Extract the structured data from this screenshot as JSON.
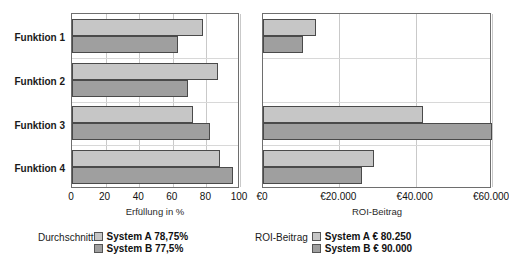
{
  "chart_data": [
    {
      "type": "bar",
      "orientation": "horizontal",
      "title": "",
      "xlabel": "Erfüllung in %",
      "ylabel": "",
      "xlim": [
        0,
        100
      ],
      "xticks": [
        0,
        20,
        40,
        60,
        80,
        100
      ],
      "xtick_labels": [
        "0",
        "20",
        "40",
        "60",
        "80",
        "100"
      ],
      "grid": true,
      "categories": [
        "Funktion 1",
        "Funktion 2",
        "Funktion 3",
        "Funktion 4"
      ],
      "series": [
        {
          "name": "System A",
          "values": [
            78,
            87,
            72,
            88
          ],
          "color": "#c6c6c6"
        },
        {
          "name": "System B",
          "values": [
            63,
            69,
            82,
            96
          ],
          "color": "#9f9f9f"
        }
      ],
      "legend_position": "below",
      "legend_caption": "Durchschnitt",
      "legend_entries": [
        "System A 78,75%",
        "System B 77,5%"
      ]
    },
    {
      "type": "bar",
      "orientation": "horizontal",
      "title": "",
      "xlabel": "ROI-Beitrag",
      "ylabel": "",
      "xlim": [
        0,
        60000
      ],
      "xticks": [
        0,
        20000,
        40000,
        60000
      ],
      "xtick_labels": [
        "€0",
        "€20.000",
        "€40.000",
        "€60.000"
      ],
      "grid": true,
      "categories": [
        "Funktion 1",
        "Funktion 2",
        "Funktion 3",
        "Funktion 4"
      ],
      "series": [
        {
          "name": "System A",
          "values": [
            14000,
            0,
            42000,
            29000
          ],
          "color": "#c6c6c6"
        },
        {
          "name": "System B",
          "values": [
            10500,
            0,
            60000,
            26000
          ],
          "color": "#9f9f9f"
        }
      ],
      "legend_position": "below",
      "legend_caption": "ROI-Beitrag",
      "legend_entries": [
        "System A € 80.250",
        "System B € 90.000"
      ]
    }
  ],
  "left_chart": {
    "axis_title": "Erfüllung in %",
    "ticks": [
      "0",
      "20",
      "40",
      "60",
      "80",
      "100"
    ],
    "categories": [
      "Funktion 1",
      "Funktion 2",
      "Funktion 3",
      "Funktion 4"
    ],
    "legend": {
      "caption": "Durchschnitt",
      "rows": [
        {
          "label": "System A 78,75%"
        },
        {
          "label": "System B 77,5%"
        }
      ]
    }
  },
  "right_chart": {
    "axis_title": "ROI-Beitrag",
    "ticks": [
      "€0",
      "€20.000",
      "€40.000",
      "€60.000"
    ],
    "legend": {
      "caption": "ROI-Beitrag",
      "rows": [
        {
          "label": "System A € 80.250"
        },
        {
          "label": "System B € 90.000"
        }
      ]
    }
  },
  "colors": {
    "series_a": "#c6c6c6",
    "series_b": "#9f9f9f",
    "frame": "#6e6e6e",
    "grid": "#c9c9c9",
    "bar_edge": "#4a4a4a"
  }
}
